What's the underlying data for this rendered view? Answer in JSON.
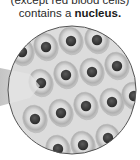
{
  "caption": {
    "line1": "(except red blood cells)",
    "line2_prefix": "contains a ",
    "line2_bold": "nucleus."
  },
  "illustration": {
    "name": "magnified-cells-circle",
    "description": "Circular magnified view of tissue cells, each showing a dark nucleus",
    "colors": {
      "background": "#d9d9d9",
      "cell_outer": "#bdbdbd",
      "cell_inner": "#e6e6e6",
      "nucleus": "#3a3a3a",
      "border": "#555555",
      "beam": "#cfcfcf"
    },
    "cells": [
      {
        "cx": 22,
        "cy": 52
      },
      {
        "cx": 46,
        "cy": 47
      },
      {
        "cx": 71,
        "cy": 41
      },
      {
        "cx": 97,
        "cy": 40
      },
      {
        "cx": 41,
        "cy": 83
      },
      {
        "cx": 66,
        "cy": 75
      },
      {
        "cx": 92,
        "cy": 72
      },
      {
        "cx": 117,
        "cy": 66
      },
      {
        "cx": 35,
        "cy": 119
      },
      {
        "cx": 61,
        "cy": 113
      },
      {
        "cx": 86,
        "cy": 106
      },
      {
        "cx": 112,
        "cy": 102
      },
      {
        "cx": 134,
        "cy": 96
      },
      {
        "cx": 58,
        "cy": 149
      },
      {
        "cx": 83,
        "cy": 145
      },
      {
        "cx": 108,
        "cy": 138
      }
    ]
  }
}
